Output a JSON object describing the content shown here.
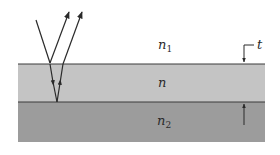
{
  "diagram": {
    "colors": {
      "background": "#ffffff",
      "film": "#c4c4c4",
      "substrate": "#9c9c9c",
      "line": "#2a2a2a"
    },
    "regions": [
      {
        "id": "medium-above",
        "label": "n",
        "subscript": "1"
      },
      {
        "id": "film",
        "label": "n",
        "subscript": ""
      },
      {
        "id": "substrate",
        "label": "n",
        "subscript": "2"
      }
    ],
    "thickness_label": "t",
    "rays": [
      {
        "id": "incident",
        "desc": "incident ray"
      },
      {
        "id": "reflected-top",
        "desc": "ray reflected at top surface"
      },
      {
        "id": "refracted-down",
        "desc": "ray transmitted into film"
      },
      {
        "id": "reflected-bottom",
        "desc": "ray reflected at bottom surface"
      },
      {
        "id": "emerging",
        "desc": "ray emerging from film"
      }
    ]
  }
}
